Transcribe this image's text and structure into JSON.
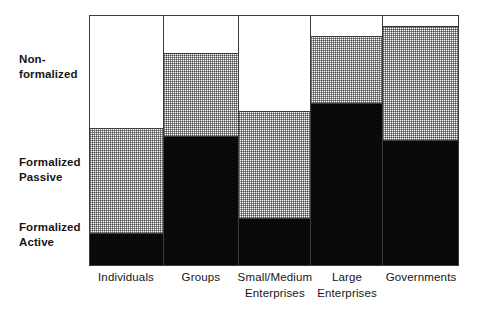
{
  "chart_data": {
    "type": "bar",
    "subtype": "stacked-100-percent-marimekko",
    "title": "",
    "subtitle": "",
    "xlabel": "",
    "ylabel": "",
    "ylim": [
      0,
      100
    ],
    "grid": false,
    "legend_position": "y-axis-left",
    "orientation": "vertical",
    "stack_mode": "percent",
    "categories": [
      "Individuals",
      "Small/Medium Enterprises",
      "Groups",
      "Large Enterprises",
      "Governments"
    ],
    "category_lines": [
      [
        "Individuals"
      ],
      [
        "Groups"
      ],
      [
        "Small/Medium",
        "Enterprises"
      ],
      [
        "Large",
        "Enterprises"
      ],
      [
        "Governments"
      ]
    ],
    "category_widths_pct": [
      20.0,
      20.5,
      19.5,
      19.5,
      20.5
    ],
    "series": [
      {
        "name": "Non-formalized",
        "fill": "white",
        "color": "#ffffff",
        "values": [
          45,
          15,
          38,
          8,
          4
        ]
      },
      {
        "name": "Formalized Passive",
        "fill": "stipple",
        "color": "#c8c8c8",
        "values": [
          42,
          33,
          43,
          27,
          46
        ]
      },
      {
        "name": "Formalized Active",
        "fill": "solid-black",
        "color": "#0a0a0a",
        "values": [
          13,
          52,
          19,
          65,
          50
        ]
      }
    ],
    "axis_labels": {
      "nonformalized": "Non-\nformalized",
      "formalized_passive": "Formalized\nPassive",
      "formalized_active": "Formalized\nActive"
    },
    "colors": {
      "background": "#ffffff",
      "axis_line": "#3c3c3c",
      "text": "#161616",
      "segment_nonformalized": "#ffffff",
      "segment_passive": "#c8c8c8",
      "segment_active": "#0a0a0a"
    },
    "columns": [
      {
        "category": "Individuals",
        "label_lines": [
          "Individuals"
        ],
        "width_pct": 20.0,
        "nonformalized": 45,
        "formalized_passive": 42,
        "formalized_active": 13
      },
      {
        "category": "Groups",
        "label_lines": [
          "Groups"
        ],
        "width_pct": 20.5,
        "nonformalized": 15,
        "formalized_passive": 33,
        "formalized_active": 52
      },
      {
        "category": "Small/Medium Enterprises",
        "label_lines": [
          "Small/Medium",
          "Enterprises"
        ],
        "width_pct": 19.5,
        "nonformalized": 38,
        "formalized_passive": 43,
        "formalized_active": 19
      },
      {
        "category": "Large Enterprises",
        "label_lines": [
          "Large",
          "Enterprises"
        ],
        "width_pct": 19.5,
        "nonformalized": 8,
        "formalized_passive": 27,
        "formalized_active": 65
      },
      {
        "category": "Governments",
        "label_lines": [
          "Governments"
        ],
        "width_pct": 20.5,
        "nonformalized": 4,
        "formalized_passive": 46,
        "formalized_active": 50
      }
    ]
  }
}
